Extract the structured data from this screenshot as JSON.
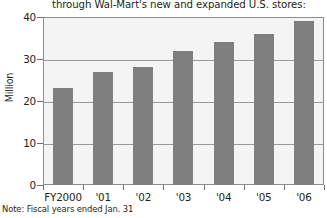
{
  "chart_data": {
    "type": "bar",
    "title": "through Wal-Mart's  new and expanded U.S. stores:",
    "xlabel": "",
    "ylabel": "Million",
    "categories": [
      "FY2000",
      "'01",
      "'02",
      "'03",
      "'04",
      "'05",
      "'06"
    ],
    "values": [
      23,
      27,
      28,
      32,
      34,
      36,
      39
    ],
    "ylim": [
      0,
      40
    ],
    "yticks": [
      0,
      10,
      20,
      30,
      40
    ],
    "ytick_labels": [
      "0",
      "10",
      "20",
      "30",
      "40"
    ],
    "grid": true,
    "legend": false,
    "note": "Note: Fiscal years ended Jan. 31",
    "series": [
      {
        "name": "U.S. store customers",
        "values": [
          23,
          27,
          28,
          32,
          34,
          36,
          39
        ],
        "color": "#7f7f7f"
      }
    ],
    "colors": {
      "bar": "#7f7f7f",
      "plot_background": "#f4f4f4",
      "grid": "#9a9a9a",
      "frame": "#8d8d8d",
      "text": "#231f20",
      "page_background": "#ffffff"
    }
  }
}
